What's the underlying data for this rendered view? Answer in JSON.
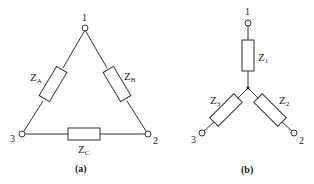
{
  "delta": {
    "caption": "(a)",
    "nodes": [
      {
        "id": "1",
        "label": "1",
        "x": 85,
        "y": 27
      },
      {
        "id": "2",
        "label": "2",
        "x": 148,
        "y": 134
      },
      {
        "id": "3",
        "label": "3",
        "x": 22,
        "y": 134
      }
    ],
    "impedances": [
      {
        "name": "Z",
        "sub": "A",
        "between": [
          "1",
          "3"
        ]
      },
      {
        "name": "Z",
        "sub": "B",
        "between": [
          "1",
          "2"
        ]
      },
      {
        "name": "Z",
        "sub": "C",
        "between": [
          "3",
          "2"
        ]
      }
    ]
  },
  "wye": {
    "caption": "(b)",
    "center": {
      "x": 248,
      "y": 88
    },
    "nodes": [
      {
        "id": "1",
        "label": "1",
        "x": 248,
        "y": 22
      },
      {
        "id": "2",
        "label": "2",
        "x": 294,
        "y": 133
      },
      {
        "id": "3",
        "label": "3",
        "x": 202,
        "y": 133
      }
    ],
    "impedances": [
      {
        "name": "Z",
        "sub": "1",
        "to": "1"
      },
      {
        "name": "Z",
        "sub": "2",
        "to": "2"
      },
      {
        "name": "Z",
        "sub": "3",
        "to": "3"
      }
    ]
  },
  "colors": {
    "line": "#333333",
    "background": "#ffffff"
  }
}
